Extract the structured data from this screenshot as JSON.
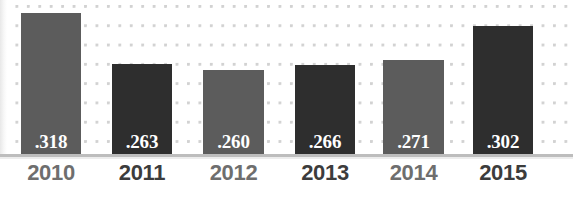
{
  "chart_data": {
    "type": "bar",
    "title": "",
    "subtitle": "",
    "xlabel": "",
    "ylabel": "",
    "grid": "dotted",
    "legend": "none",
    "ylim": [
      0,
      0.348
    ],
    "categories": [
      "2010",
      "2011",
      "2012",
      "2013",
      "2014",
      "2015"
    ],
    "values": [
      0.318,
      0.263,
      0.26,
      0.266,
      0.271,
      0.302
    ],
    "value_labels": [
      ".318",
      ".263",
      ".260",
      ".266",
      ".271",
      ".302"
    ],
    "series": [
      {
        "name": "",
        "values": [
          0.318,
          0.263,
          0.26,
          0.266,
          0.271,
          0.302
        ]
      }
    ],
    "bar_colors": [
      "#5c5c5c",
      "#2e2e2e",
      "#5c5c5c",
      "#2e2e2e",
      "#5c5c5c",
      "#2e2e2e"
    ]
  },
  "colors": {
    "bar_light": "#5c5c5c",
    "bar_dark": "#2e2e2e",
    "value_text": "#ffffff",
    "year_light": "#6e6e6e",
    "year_dark": "#3c3c3c",
    "grid_dot": "#d2d2d2",
    "axis_line": "#bdbdbd",
    "background": "#ffffff"
  },
  "bars": [
    {
      "category": "2010",
      "value": 0.318,
      "label": ".318",
      "tone": "light",
      "x": 21,
      "width": 60,
      "top": 13
    },
    {
      "category": "2011",
      "value": 0.263,
      "label": ".263",
      "tone": "dark",
      "x": 112,
      "width": 60,
      "top": 64
    },
    {
      "category": "2012",
      "value": 0.26,
      "label": ".260",
      "tone": "light",
      "x": 203,
      "width": 61,
      "top": 70
    },
    {
      "category": "2013",
      "value": 0.266,
      "label": ".266",
      "tone": "dark",
      "x": 295,
      "width": 60,
      "top": 65
    },
    {
      "category": "2014",
      "value": 0.271,
      "label": ".271",
      "tone": "light",
      "x": 383,
      "width": 61,
      "top": 60
    },
    {
      "category": "2015",
      "value": 0.302,
      "label": ".302",
      "tone": "dark",
      "x": 473,
      "width": 60,
      "top": 26
    }
  ]
}
